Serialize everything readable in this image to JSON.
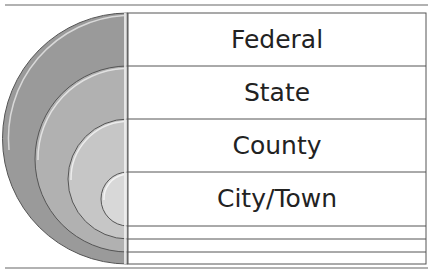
{
  "diagram": {
    "type": "nested-semicircles-with-rows",
    "levels": [
      {
        "label": "Federal",
        "fill": "#9a9a9a"
      },
      {
        "label": "State",
        "fill": "#b1b1b1"
      },
      {
        "label": "County",
        "fill": "#c6c6c6"
      },
      {
        "label": "City/Town",
        "fill": "#d8d8d8"
      }
    ],
    "colors": {
      "line": "#555555",
      "rule": "#666666",
      "highlight": "#f2f2f2",
      "text": "#222222"
    }
  }
}
